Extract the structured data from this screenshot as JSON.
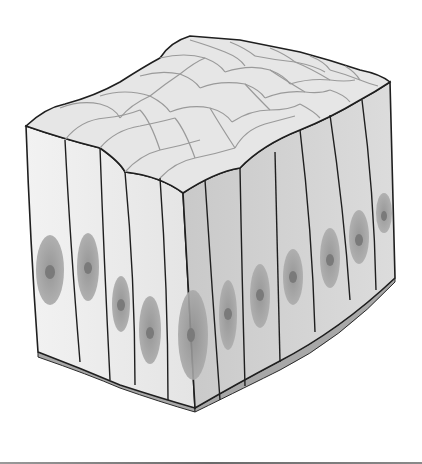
{
  "diagram": {
    "style": "grayscale 3D block illustration",
    "colors": {
      "background": "#ffffff",
      "outline": "#1f1f1f",
      "apical_surface": "#e6e6e6",
      "apical_cell_border": "#9a9a9a",
      "front_face": "#ececec",
      "side_face": "#d2d2d2",
      "nucleus": "#9b9b9b",
      "nucleolus": "#7a7a7a",
      "basement_membrane": "#a8a8a8"
    },
    "parts": [
      {
        "name": "apical-surface",
        "description": "polygonal cell tops forming a cobblestone pattern"
      },
      {
        "name": "columnar-cells",
        "description": "tall cells on front and side faces"
      },
      {
        "name": "nuclei",
        "description": "oval nuclei near the base of each cell, each with a dark nucleolus"
      },
      {
        "name": "basement-membrane",
        "description": "thin gray layer under the cells"
      }
    ],
    "front_cells": 5,
    "side_cells": 6
  }
}
